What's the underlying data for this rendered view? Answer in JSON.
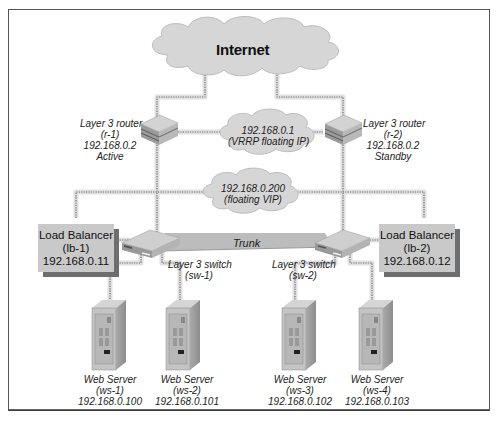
{
  "diagram": {
    "internet": {
      "label": "Internet"
    },
    "vrrp_cloud": {
      "ip": "192.168.0.1",
      "note": "(VRRP floating IP)"
    },
    "vip_cloud": {
      "ip": "192.168.0.200",
      "note": "(floating VIP)"
    },
    "routers": [
      {
        "type": "Layer 3 router",
        "id": "(r-1)",
        "ip": "192.168.0.2",
        "state": "Active"
      },
      {
        "type": "Layer 3 router",
        "id": "(r-2)",
        "ip": "192.168.0.2",
        "state": "Standby"
      }
    ],
    "load_balancers": [
      {
        "type": "Load Balancer",
        "id": "(lb-1)",
        "ip": "192.168.0.11"
      },
      {
        "type": "Load Balancer",
        "id": "(lb-2)",
        "ip": "192.168.0.12"
      }
    ],
    "switches": [
      {
        "type": "Layer 3 switch",
        "id": "(sw-1)"
      },
      {
        "type": "Layer 3 switch",
        "id": "(sw-2)"
      }
    ],
    "trunk": {
      "label": "Trunk"
    },
    "web_servers": [
      {
        "type": "Web Server",
        "id": "(ws-1)",
        "ip": "192.168.0.100"
      },
      {
        "type": "Web Server",
        "id": "(ws-2)",
        "ip": "192.168.0.101"
      },
      {
        "type": "Web Server",
        "id": "(ws-3)",
        "ip": "192.168.0.102"
      },
      {
        "type": "Web Server",
        "id": "(ws-4)",
        "ip": "192.168.0.103"
      }
    ],
    "colors": {
      "cloud_fill": "#d9d9d9",
      "link": "#8a8a8a",
      "link_halo": "#e2e2e2",
      "device": "#bdbdbd",
      "frame": "#555555"
    }
  }
}
